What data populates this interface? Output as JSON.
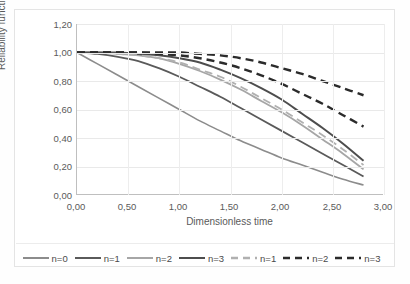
{
  "chart_data": {
    "type": "line",
    "title": "",
    "xlabel": "Dimensionless time",
    "ylabel": "Reliability function",
    "xlim": [
      0,
      3
    ],
    "ylim": [
      0,
      1.2
    ],
    "xticks": [
      "0,00",
      "0,50",
      "1,00",
      "1,50",
      "2,00",
      "2,50",
      "3,00"
    ],
    "xtick_values": [
      0,
      0.5,
      1.0,
      1.5,
      2.0,
      2.5,
      3.0
    ],
    "yticks": [
      "0,00",
      "0,20",
      "0,40",
      "0,60",
      "0,80",
      "1,00",
      "1,20"
    ],
    "ytick_values": [
      0,
      0.2,
      0.4,
      0.6,
      0.8,
      1.0,
      1.2
    ],
    "grid": true,
    "legend_position": "bottom",
    "x": [
      0.0,
      0.2,
      0.4,
      0.6,
      0.8,
      1.0,
      1.2,
      1.4,
      1.6,
      1.8,
      2.0,
      2.2,
      2.4,
      2.6,
      2.8
    ],
    "series": [
      {
        "name": "n=0",
        "label": "n=0",
        "style": "solid",
        "color": "#8c8c8c",
        "width": 1.6,
        "values": [
          1.0,
          0.92,
          0.84,
          0.76,
          0.68,
          0.6,
          0.52,
          0.45,
          0.38,
          0.32,
          0.26,
          0.21,
          0.16,
          0.11,
          0.07
        ]
      },
      {
        "name": "n=1",
        "label": "n=1",
        "style": "solid",
        "color": "#5a5a5a",
        "width": 1.8,
        "values": [
          1.0,
          0.99,
          0.97,
          0.94,
          0.89,
          0.83,
          0.76,
          0.69,
          0.61,
          0.53,
          0.45,
          0.37,
          0.29,
          0.21,
          0.13
        ]
      },
      {
        "name": "n=2",
        "label": "n=2",
        "style": "solid",
        "color": "#a6a6a6",
        "width": 1.8,
        "values": [
          1.0,
          1.0,
          0.99,
          0.98,
          0.96,
          0.92,
          0.87,
          0.81,
          0.74,
          0.66,
          0.58,
          0.49,
          0.39,
          0.29,
          0.18
        ]
      },
      {
        "name": "n=3",
        "label": "n=3",
        "style": "solid",
        "color": "#4d4d4d",
        "width": 2.0,
        "values": [
          1.0,
          1.0,
          1.0,
          0.99,
          0.98,
          0.96,
          0.93,
          0.88,
          0.82,
          0.75,
          0.67,
          0.57,
          0.47,
          0.36,
          0.24
        ]
      },
      {
        "name": "n=1-dashed",
        "label": "n=1",
        "style": "dashed",
        "color": "#b0b0b0",
        "width": 1.8,
        "values": [
          1.0,
          1.0,
          0.99,
          0.98,
          0.96,
          0.93,
          0.88,
          0.83,
          0.76,
          0.68,
          0.6,
          0.51,
          0.42,
          0.32,
          0.21
        ]
      },
      {
        "name": "n=2-dashed",
        "label": "n=2",
        "style": "dashed",
        "color": "#2b2b2b",
        "width": 2.4,
        "values": [
          1.0,
          1.0,
          1.0,
          1.0,
          0.99,
          0.98,
          0.96,
          0.93,
          0.89,
          0.84,
          0.78,
          0.71,
          0.64,
          0.56,
          0.48
        ]
      },
      {
        "name": "n=3-dashed",
        "label": "n=3",
        "style": "dashed",
        "color": "#2b2b2b",
        "width": 2.4,
        "values": [
          1.0,
          1.0,
          1.0,
          1.0,
          1.0,
          1.0,
          0.99,
          0.98,
          0.96,
          0.93,
          0.89,
          0.85,
          0.8,
          0.75,
          0.7
        ]
      }
    ]
  },
  "axes": {
    "y_title": "Reliability function",
    "x_title": "Dimensionless time",
    "y_labels": [
      "1,20",
      "1,00",
      "0,80",
      "0,60",
      "0,40",
      "0,20",
      "0,00"
    ],
    "x_labels": [
      "0,00",
      "0,50",
      "1,00",
      "1,50",
      "2,00",
      "2,50",
      "3,00"
    ]
  },
  "legend": {
    "items": [
      {
        "label": "n=0",
        "style": "solid",
        "color": "#8c8c8c"
      },
      {
        "label": "n=1",
        "style": "solid",
        "color": "#5a5a5a"
      },
      {
        "label": "n=2",
        "style": "solid",
        "color": "#a6a6a6"
      },
      {
        "label": "n=3",
        "style": "solid",
        "color": "#4d4d4d"
      },
      {
        "label": "n=1",
        "style": "dashed",
        "color": "#b0b0b0"
      },
      {
        "label": "n=2",
        "style": "dashed",
        "color": "#2b2b2b"
      },
      {
        "label": "n=3",
        "style": "dashed",
        "color": "#2b2b2b"
      }
    ]
  }
}
